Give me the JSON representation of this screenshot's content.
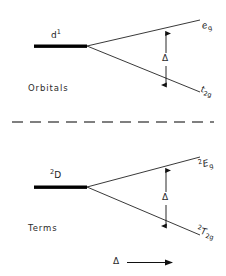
{
  "figure": {
    "divider": "dashed-separator"
  },
  "panels": [
    {
      "id": "orbitals",
      "caption": "Orbitals",
      "ground_level": {
        "text_main": "d",
        "superscript": "1"
      },
      "upper_level": {
        "text_main": "e",
        "subscript": "g",
        "italic": true
      },
      "lower_level": {
        "text_main": "t",
        "subscript": "2g",
        "italic": true
      },
      "splitting_label": "Δ"
    },
    {
      "id": "terms",
      "caption": "Terms",
      "ground_level": {
        "presuperscript": "2",
        "text_main": "D"
      },
      "upper_level": {
        "presuperscript": "2",
        "text_main": "E",
        "subscript": "g",
        "italic": true
      },
      "lower_level": {
        "presuperscript": "2",
        "text_main": "T",
        "subscript": "2g",
        "italic": true
      },
      "splitting_label": "Δ"
    }
  ],
  "axis": {
    "label": "Δ",
    "arrow": "right-arrow"
  },
  "colors": {
    "line": "#222222",
    "text": "#2b2b2b",
    "background": "#ffffff",
    "bar": "#000000"
  }
}
